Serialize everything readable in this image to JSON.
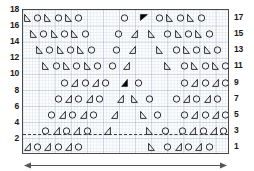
{
  "chart_data": {
    "type": "scatter",
    "title": "",
    "subtitle": "",
    "xlabel": "",
    "ylabel": "",
    "grid": true,
    "legend_position": "none",
    "background": "graph-paper",
    "plot_border_color": "#4a4a4a",
    "grid_color": "#7896be",
    "marker_color": "#1a1a1a",
    "filled_marker_color": "#000000",
    "xlim": [
      0,
      100
    ],
    "ylim": [
      0,
      18
    ],
    "left_axis": {
      "name": "left-y-axis",
      "ticks": [
        18,
        16,
        14,
        12,
        10,
        8,
        6,
        4,
        2
      ]
    },
    "right_axis": {
      "name": "right-y-axis",
      "ticks": [
        17,
        15,
        13,
        11,
        9,
        7,
        5,
        3,
        1
      ]
    },
    "reference_line": {
      "name": "dashed-reference-line",
      "y": 2.6,
      "style": "dashed",
      "color": "#3b3b3b"
    },
    "annotations": [
      {
        "name": "span-arrow",
        "type": "double-headed-arrow",
        "x_start": 0,
        "x_end": 100,
        "y": -1.2
      }
    ],
    "rows": [
      {
        "y": 17,
        "points": [
          {
            "x": 2,
            "marker": "triangle-right"
          },
          {
            "x": 7,
            "marker": "circle"
          },
          {
            "x": 12,
            "marker": "triangle-right"
          },
          {
            "x": 17,
            "marker": "circle"
          },
          {
            "x": 22,
            "marker": "triangle-right"
          },
          {
            "x": 27,
            "marker": "circle"
          },
          {
            "x": 49,
            "marker": "circle"
          },
          {
            "x": 58,
            "marker": "triangle-flipped-filled"
          },
          {
            "x": 66,
            "marker": "circle"
          },
          {
            "x": 71,
            "marker": "triangle-right"
          },
          {
            "x": 76,
            "marker": "circle"
          },
          {
            "x": 81,
            "marker": "triangle-right"
          },
          {
            "x": 86,
            "marker": "circle"
          }
        ]
      },
      {
        "y": 15,
        "points": [
          {
            "x": 5,
            "marker": "triangle-right"
          },
          {
            "x": 10,
            "marker": "circle"
          },
          {
            "x": 15,
            "marker": "triangle-right"
          },
          {
            "x": 20,
            "marker": "circle"
          },
          {
            "x": 25,
            "marker": "triangle-right"
          },
          {
            "x": 30,
            "marker": "circle"
          },
          {
            "x": 46,
            "marker": "circle"
          },
          {
            "x": 54,
            "marker": "triangle-left"
          },
          {
            "x": 62,
            "marker": "triangle-right"
          },
          {
            "x": 70,
            "marker": "circle"
          },
          {
            "x": 75,
            "marker": "triangle-right"
          },
          {
            "x": 80,
            "marker": "circle"
          },
          {
            "x": 85,
            "marker": "triangle-right"
          },
          {
            "x": 90,
            "marker": "circle"
          }
        ]
      },
      {
        "y": 13,
        "points": [
          {
            "x": 8,
            "marker": "triangle-right"
          },
          {
            "x": 13,
            "marker": "circle"
          },
          {
            "x": 18,
            "marker": "triangle-right"
          },
          {
            "x": 23,
            "marker": "circle"
          },
          {
            "x": 28,
            "marker": "triangle-right"
          },
          {
            "x": 33,
            "marker": "circle"
          },
          {
            "x": 45,
            "marker": "circle"
          },
          {
            "x": 53,
            "marker": "triangle-left"
          },
          {
            "x": 66,
            "marker": "triangle-right"
          },
          {
            "x": 74,
            "marker": "circle"
          },
          {
            "x": 79,
            "marker": "triangle-right"
          },
          {
            "x": 84,
            "marker": "circle"
          },
          {
            "x": 89,
            "marker": "triangle-right"
          },
          {
            "x": 94,
            "marker": "circle"
          }
        ]
      },
      {
        "y": 11,
        "points": [
          {
            "x": 11,
            "marker": "triangle-right"
          },
          {
            "x": 16,
            "marker": "circle"
          },
          {
            "x": 21,
            "marker": "triangle-right"
          },
          {
            "x": 26,
            "marker": "circle"
          },
          {
            "x": 31,
            "marker": "triangle-right"
          },
          {
            "x": 36,
            "marker": "circle"
          },
          {
            "x": 43,
            "marker": "circle"
          },
          {
            "x": 50,
            "marker": "triangle-left"
          },
          {
            "x": 70,
            "marker": "triangle-right"
          },
          {
            "x": 78,
            "marker": "circle"
          },
          {
            "x": 83,
            "marker": "triangle-right"
          },
          {
            "x": 88,
            "marker": "circle"
          },
          {
            "x": 93,
            "marker": "triangle-right"
          },
          {
            "x": 98,
            "marker": "circle"
          }
        ]
      },
      {
        "y": 9,
        "points": [
          {
            "x": 20,
            "marker": "circle"
          },
          {
            "x": 25,
            "marker": "triangle-left"
          },
          {
            "x": 30,
            "marker": "circle"
          },
          {
            "x": 35,
            "marker": "triangle-left"
          },
          {
            "x": 40,
            "marker": "circle"
          },
          {
            "x": 49,
            "marker": "triangle-filled"
          },
          {
            "x": 56,
            "marker": "circle"
          },
          {
            "x": 78,
            "marker": "circle"
          },
          {
            "x": 83,
            "marker": "triangle-left"
          },
          {
            "x": 88,
            "marker": "circle"
          },
          {
            "x": 93,
            "marker": "triangle-left"
          },
          {
            "x": 98,
            "marker": "circle"
          },
          {
            "x": 103,
            "marker": "triangle-left"
          }
        ]
      },
      {
        "y": 7,
        "points": [
          {
            "x": 17,
            "marker": "circle"
          },
          {
            "x": 22,
            "marker": "triangle-left"
          },
          {
            "x": 27,
            "marker": "circle"
          },
          {
            "x": 32,
            "marker": "triangle-left"
          },
          {
            "x": 37,
            "marker": "circle"
          },
          {
            "x": 47,
            "marker": "triangle-left"
          },
          {
            "x": 54,
            "marker": "triangle-right"
          },
          {
            "x": 61,
            "marker": "circle"
          },
          {
            "x": 74,
            "marker": "circle"
          },
          {
            "x": 79,
            "marker": "triangle-left"
          },
          {
            "x": 84,
            "marker": "circle"
          },
          {
            "x": 89,
            "marker": "triangle-left"
          },
          {
            "x": 94,
            "marker": "circle"
          }
        ]
      },
      {
        "y": 5,
        "points": [
          {
            "x": 14,
            "marker": "circle"
          },
          {
            "x": 19,
            "marker": "triangle-left"
          },
          {
            "x": 24,
            "marker": "circle"
          },
          {
            "x": 29,
            "marker": "triangle-left"
          },
          {
            "x": 34,
            "marker": "circle"
          },
          {
            "x": 44,
            "marker": "triangle-left"
          },
          {
            "x": 58,
            "marker": "triangle-right"
          },
          {
            "x": 65,
            "marker": "circle"
          },
          {
            "x": 78,
            "marker": "circle"
          },
          {
            "x": 83,
            "marker": "triangle-left"
          },
          {
            "x": 88,
            "marker": "circle"
          },
          {
            "x": 93,
            "marker": "triangle-left"
          },
          {
            "x": 98,
            "marker": "circle"
          }
        ]
      },
      {
        "y": 3,
        "points": [
          {
            "x": 11,
            "marker": "circle"
          },
          {
            "x": 16,
            "marker": "triangle-left"
          },
          {
            "x": 21,
            "marker": "circle"
          },
          {
            "x": 26,
            "marker": "triangle-left"
          },
          {
            "x": 31,
            "marker": "circle"
          },
          {
            "x": 41,
            "marker": "triangle-left"
          },
          {
            "x": 61,
            "marker": "triangle-right"
          },
          {
            "x": 69,
            "marker": "circle"
          },
          {
            "x": 77,
            "marker": "circle"
          },
          {
            "x": 82,
            "marker": "triangle-left"
          },
          {
            "x": 87,
            "marker": "circle"
          },
          {
            "x": 92,
            "marker": "triangle-left"
          },
          {
            "x": 97,
            "marker": "circle"
          },
          {
            "x": 102,
            "marker": "triangle-left"
          }
        ]
      },
      {
        "y": 1,
        "points": [
          {
            "x": 2,
            "marker": "triangle-left"
          },
          {
            "x": 7,
            "marker": "circle"
          },
          {
            "x": 12,
            "marker": "triangle-left"
          },
          {
            "x": 17,
            "marker": "circle"
          },
          {
            "x": 22,
            "marker": "triangle-left"
          },
          {
            "x": 27,
            "marker": "circle"
          },
          {
            "x": 62,
            "marker": "triangle-right"
          },
          {
            "x": 70,
            "marker": "circle"
          },
          {
            "x": 75,
            "marker": "triangle-left"
          },
          {
            "x": 80,
            "marker": "circle"
          },
          {
            "x": 85,
            "marker": "triangle-left"
          },
          {
            "x": 90,
            "marker": "circle"
          }
        ]
      }
    ]
  }
}
